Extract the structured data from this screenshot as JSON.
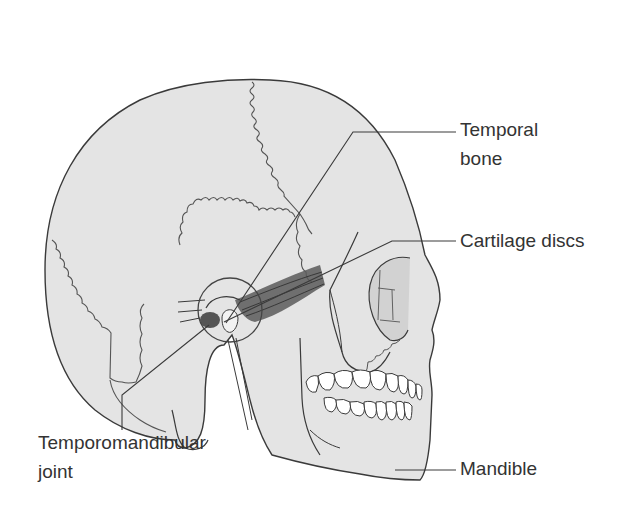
{
  "diagram": {
    "labels": {
      "temporal_bone_line1": "Temporal",
      "temporal_bone_line2": "bone",
      "cartilage_discs": "Cartilage discs",
      "tmj_line1": "Temporomandibular",
      "tmj_line2": "joint",
      "mandible": "Mandible"
    },
    "colors": {
      "bone_fill": "#e4e4e4",
      "outline": "#3a3a3a",
      "muscle": "#5a5a5a",
      "teeth": "#ffffff",
      "label_text": "#333333",
      "background": "#ffffff"
    }
  }
}
